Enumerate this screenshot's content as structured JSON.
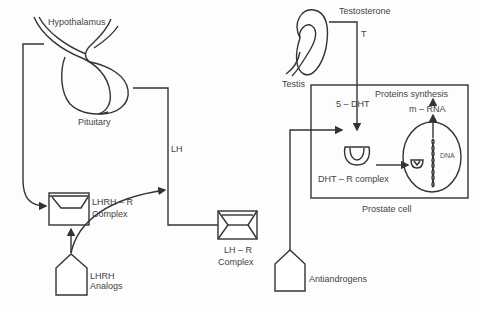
{
  "diagram": {
    "labels": {
      "hypothalamus": "Hypothalamus",
      "pituitary": "Pituitary",
      "lh": "LH",
      "lhrh_r_complex_line1": "LHRH – R",
      "lhrh_r_complex_line2": "Complex",
      "lh_r_complex_line1": "LH – R",
      "lh_r_complex_line2": "Complex",
      "lhrh_analogs_line1": "LHRH",
      "lhrh_analogs_line2": "Analogs",
      "testis": "Testis",
      "testosterone": "Testosterone",
      "t": "T",
      "five_dht": "5 – DHT",
      "proteins_synthesis": "Proteins synthesis",
      "m_rna": "m – RNA",
      "dna": "DNA",
      "dht_r_complex": "DHT – R complex",
      "prostate_cell": "Prostate cell",
      "antiandrogens": "Antiandrogens"
    },
    "colors": {
      "stroke": "#333333",
      "text": "#444444",
      "background": "#fdfdfd"
    }
  }
}
